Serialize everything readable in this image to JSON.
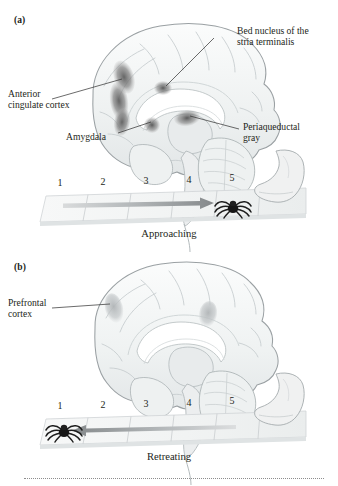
{
  "figure": {
    "type": "scientific-illustration",
    "panels": [
      {
        "letter": "(a)",
        "brain_alt": "midsagittal-brain-approaching",
        "caption": "Approaching",
        "arrow_direction": "right",
        "spider_position": 5,
        "track_numbers": [
          "1",
          "2",
          "3",
          "4",
          "5"
        ],
        "labels": [
          {
            "name": "bed-nucleus-stria-terminalis",
            "text": "Bed nucleus of the\nstria terminalis"
          },
          {
            "name": "anterior-cingulate-cortex",
            "text": "Anterior\ncingulate cortex"
          },
          {
            "name": "amygdala",
            "text": "Amygdala"
          },
          {
            "name": "periaqueductal-gray",
            "text": "Periaqueductal\ngray"
          }
        ]
      },
      {
        "letter": "(b)",
        "brain_alt": "midsagittal-brain-retreating",
        "caption": "Retreating",
        "arrow_direction": "left",
        "spider_position": 1,
        "track_numbers": [
          "1",
          "2",
          "3",
          "4",
          "5"
        ],
        "labels": [
          {
            "name": "prefrontal-cortex",
            "text": "Prefrontal\ncortex"
          }
        ]
      }
    ]
  },
  "colors": {
    "text": "#231f20",
    "brain_outline": "#9aa0a3",
    "brain_fill": "#f2f4f4",
    "highlight_dark": "#6e6e6e",
    "highlight_light": "#b9bcbd",
    "arrow": "#8b8f91",
    "track_line": "#c9cdcf",
    "leader_line": "#3a3a3a",
    "rule": "#8d8d8d"
  }
}
